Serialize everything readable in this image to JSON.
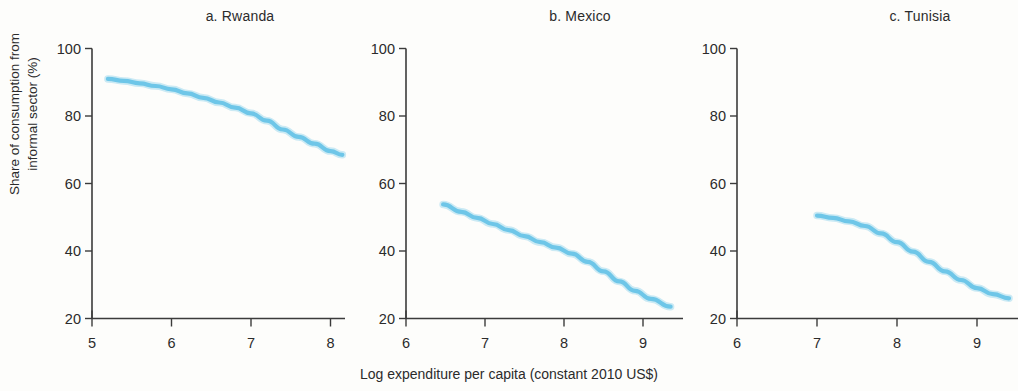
{
  "figure": {
    "ylabel_line1": "Share of consumption from",
    "ylabel_line2": "informal sector (%)",
    "xlabel": "Log expenditure per capita (constant 2010 US$)",
    "line_color": "#6ec6e8",
    "axis_color": "#3b3b3b",
    "background": "#fdfdfb"
  },
  "chart_data": [
    {
      "type": "line",
      "title": "a. Rwanda",
      "xlabel": "Log expenditure per capita (constant 2010 US$)",
      "ylabel": "Share of consumption from informal sector (%)",
      "xlim": [
        4.75,
        8.35
      ],
      "ylim": [
        20,
        100
      ],
      "xticks": [
        5,
        6,
        7,
        8
      ],
      "yticks": [
        20,
        40,
        60,
        80,
        100
      ],
      "grid": false,
      "legend": "none",
      "series": [
        {
          "name": "Rwanda",
          "color": "#6ec6e8",
          "x": [
            5.2,
            5.4,
            5.6,
            5.8,
            6.0,
            6.2,
            6.4,
            6.6,
            6.8,
            7.0,
            7.2,
            7.4,
            7.6,
            7.8,
            8.0,
            8.15
          ],
          "values": [
            91.0,
            90.4,
            89.7,
            88.9,
            87.9,
            86.7,
            85.4,
            84.0,
            82.5,
            80.8,
            78.6,
            76.0,
            73.8,
            71.8,
            69.6,
            68.5
          ]
        }
      ]
    },
    {
      "type": "line",
      "title": "b. Mexico",
      "xlabel": "Log expenditure per capita (constant 2010 US$)",
      "ylabel": "Share of consumption from informal sector (%)",
      "xlim": [
        5.85,
        9.45
      ],
      "ylim": [
        20,
        100
      ],
      "xticks": [
        6,
        7,
        8,
        9
      ],
      "yticks": [
        20,
        40,
        60,
        80,
        100
      ],
      "grid": false,
      "legend": "none",
      "series": [
        {
          "name": "Mexico",
          "color": "#6ec6e8",
          "x": [
            6.47,
            6.7,
            6.9,
            7.1,
            7.3,
            7.5,
            7.7,
            7.9,
            8.1,
            8.3,
            8.5,
            8.7,
            8.9,
            9.1,
            9.35
          ],
          "values": [
            53.8,
            51.6,
            49.8,
            48.0,
            46.2,
            44.4,
            42.6,
            41.0,
            39.2,
            36.8,
            34.0,
            31.0,
            28.2,
            25.8,
            23.5
          ]
        }
      ]
    },
    {
      "type": "line",
      "title": "c. Tunisia",
      "xlabel": "Log expenditure per capita (constant 2010 US$)",
      "ylabel": "Share of consumption from informal sector (%)",
      "xlim": [
        5.85,
        9.5
      ],
      "ylim": [
        20,
        100
      ],
      "xticks": [
        6,
        7,
        8,
        9
      ],
      "yticks": [
        20,
        40,
        60,
        80,
        100
      ],
      "grid": false,
      "legend": "none",
      "series": [
        {
          "name": "Tunisia",
          "color": "#6ec6e8",
          "x": [
            7.0,
            7.2,
            7.4,
            7.6,
            7.8,
            8.0,
            8.2,
            8.4,
            8.6,
            8.8,
            9.0,
            9.2,
            9.4
          ],
          "values": [
            50.5,
            49.8,
            48.8,
            47.4,
            45.2,
            42.6,
            39.8,
            36.8,
            34.0,
            31.4,
            29.0,
            27.2,
            26.0
          ]
        }
      ]
    }
  ],
  "panels": [
    {
      "id": "a",
      "title": "a. Rwanda",
      "x_tick_labels": [
        "5",
        "6",
        "7",
        "8"
      ],
      "y_tick_labels": [
        "20",
        "40",
        "60",
        "80",
        "100"
      ]
    },
    {
      "id": "b",
      "title": "b. Mexico",
      "x_tick_labels": [
        "6",
        "7",
        "8",
        "9"
      ],
      "y_tick_labels": [
        "20",
        "40",
        "60",
        "80",
        "100"
      ]
    },
    {
      "id": "c",
      "title": "c. Tunisia",
      "x_tick_labels": [
        "6",
        "7",
        "8",
        "9"
      ],
      "y_tick_labels": [
        "20",
        "40",
        "60",
        "80",
        "100"
      ]
    }
  ]
}
